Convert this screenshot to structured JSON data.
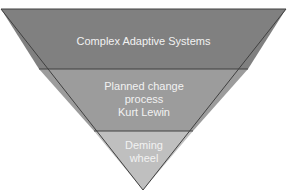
{
  "diagram": {
    "type": "inverted-pyramid",
    "levels": [
      {
        "label": "Complex Adaptive Systems",
        "lines": [
          "Complex Adaptive Systems"
        ],
        "color": "#808080"
      },
      {
        "label": "Planned change process Kurt Lewin",
        "lines": [
          "Planned change",
          "process",
          "Kurt Lewin"
        ],
        "color": "#9c9c9c"
      },
      {
        "label": "Deming wheel",
        "lines": [
          "Deming",
          "wheel"
        ],
        "color": "#bfbfbf"
      }
    ],
    "outline_color": "#404040",
    "text_color": "#f2f2f2"
  }
}
